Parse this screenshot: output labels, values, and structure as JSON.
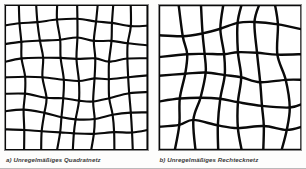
{
  "figure": {
    "panels": [
      {
        "id": "quadratnetz",
        "caption": "a) Unregelmäßiges Quadratnetz",
        "grid_label": "irregular square mesh",
        "line_color": "#000000",
        "background_color": "#ffffff",
        "frame_color": "#8c8c8c",
        "rows": 8,
        "columns": 8,
        "line_width": 2.1
      },
      {
        "id": "rechtecknetz",
        "caption": "b) Unregelmäßiges Rechtecknetz",
        "grid_label": "irregular rectangular mesh",
        "line_color": "#000000",
        "background_color": "#ffffff",
        "frame_color": "#8c8c8c",
        "rows": 6,
        "columns": 7,
        "line_width": 2.4
      }
    ]
  },
  "chart_data": {
    "type": "diagram",
    "title": "",
    "panels": [
      {
        "name": "a) Unregelmäßiges Quadratnetz",
        "mesh_type": "irregular square grid",
        "cells_x": 8,
        "cells_y": 8,
        "vertical_lines_interior": 7,
        "horizontal_lines_interior": 7,
        "distortion": "wavy / sinusoidal displacement of nodes",
        "vertical_line_x_fractions": [
          0.0,
          0.128,
          0.253,
          0.378,
          0.503,
          0.628,
          0.753,
          0.878,
          1.0
        ],
        "horizontal_line_y_fractions": [
          0.0,
          0.126,
          0.252,
          0.378,
          0.503,
          0.629,
          0.755,
          0.878,
          1.0
        ]
      },
      {
        "name": "b) Unregelmäßiges Rechtecknetz",
        "mesh_type": "irregular rectangular grid",
        "cells_x": 7,
        "cells_y": 6,
        "vertical_lines_interior": 6,
        "horizontal_lines_interior": 5,
        "distortion": "stronger wavy / sinusoidal displacement of nodes",
        "vertical_line_x_fractions": [
          0.0,
          0.145,
          0.29,
          0.435,
          0.575,
          0.715,
          0.86,
          1.0
        ],
        "horizontal_line_y_fractions": [
          0.0,
          0.168,
          0.335,
          0.5,
          0.668,
          0.835,
          1.0
        ]
      }
    ]
  }
}
